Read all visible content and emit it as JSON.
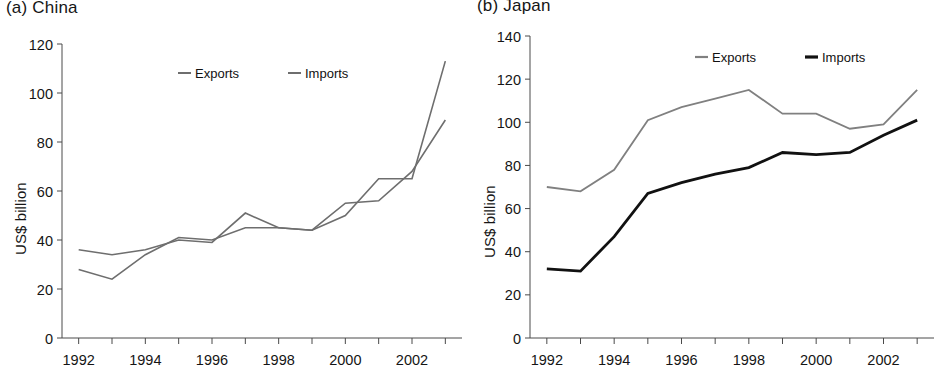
{
  "figure": {
    "panels": [
      {
        "key": "china",
        "title": "(a) China",
        "ylabel": "US$ billion"
      },
      {
        "key": "japan",
        "title": "(b) Japan",
        "ylabel": "US$ billion"
      }
    ]
  },
  "chart_data": [
    {
      "type": "line",
      "title": "(a) China",
      "xlabel": "",
      "ylabel": "US$ billion",
      "x": [
        1992,
        1993,
        1994,
        1995,
        1996,
        1997,
        1998,
        1999,
        2000,
        2001,
        2002,
        2003
      ],
      "xtick_labels": [
        "1992",
        "1994",
        "1996",
        "1998",
        "2000",
        "2002"
      ],
      "xticks": [
        1992,
        1994,
        1996,
        1998,
        2000,
        2002
      ],
      "xlim": [
        1991.5,
        2003.5
      ],
      "ytick_labels": [
        "0",
        "20",
        "40",
        "60",
        "80",
        "100",
        "120"
      ],
      "yticks": [
        0,
        20,
        40,
        60,
        80,
        100,
        120
      ],
      "ylim": [
        0,
        120
      ],
      "grid": false,
      "legend_position": "top-center",
      "series": [
        {
          "name": "Exports",
          "color": "#6e6e6e",
          "width": 1.6,
          "values": [
            28,
            24,
            34,
            41,
            40,
            45,
            45,
            44,
            55,
            56,
            68,
            89
          ]
        },
        {
          "name": "Imports",
          "color": "#6e6e6e",
          "width": 1.6,
          "values": [
            36,
            34,
            36,
            40,
            39,
            51,
            45,
            44,
            50,
            65,
            65,
            113
          ]
        }
      ]
    },
    {
      "type": "line",
      "title": "(b) Japan",
      "xlabel": "",
      "ylabel": "US$ billion",
      "x": [
        1992,
        1993,
        1994,
        1995,
        1996,
        1997,
        1998,
        1999,
        2000,
        2001,
        2002,
        2003
      ],
      "xtick_labels": [
        "1992",
        "1994",
        "1996",
        "1998",
        "2000",
        "2002"
      ],
      "xticks": [
        1992,
        1994,
        1996,
        1998,
        2000,
        2002
      ],
      "xlim": [
        1991.5,
        2003.5
      ],
      "ytick_labels": [
        "0",
        "20",
        "40",
        "60",
        "80",
        "100",
        "120",
        "140"
      ],
      "yticks": [
        0,
        20,
        40,
        60,
        80,
        100,
        120,
        140
      ],
      "ylim": [
        0,
        140
      ],
      "grid": false,
      "legend_position": "top-center",
      "series": [
        {
          "name": "Exports",
          "color": "#808080",
          "width": 1.8,
          "values": [
            70,
            68,
            78,
            101,
            107,
            111,
            115,
            104,
            104,
            97,
            99,
            115
          ]
        },
        {
          "name": "Imports",
          "color": "#111111",
          "width": 2.8,
          "values": [
            32,
            31,
            47,
            67,
            72,
            76,
            79,
            86,
            85,
            86,
            94,
            101
          ]
        }
      ]
    }
  ]
}
